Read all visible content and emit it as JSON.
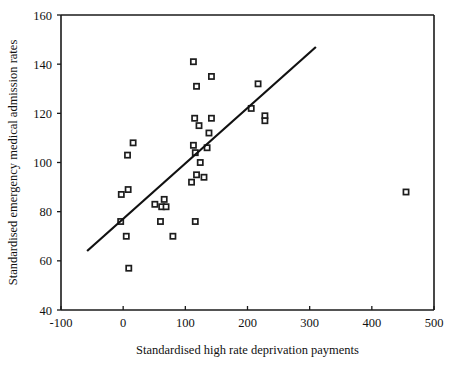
{
  "chart_data": {
    "type": "scatter",
    "title": "",
    "xlabel": "Standardised high rate deprivation payments",
    "ylabel": "Standardised emergency medical admission rates",
    "xlim": [
      -100,
      500
    ],
    "ylim": [
      40,
      160
    ],
    "xticks": [
      -100,
      0,
      100,
      200,
      300,
      400,
      500
    ],
    "yticks": [
      40,
      60,
      80,
      100,
      120,
      140,
      160
    ],
    "xtick_labels": [
      "-100",
      "0",
      "100",
      "200",
      "300",
      "400",
      "500"
    ],
    "ytick_labels": [
      "40",
      "60",
      "80",
      "100",
      "120",
      "140",
      "160"
    ],
    "grid": false,
    "legend": null,
    "marker_style": "open-square",
    "points": [
      {
        "x": 113,
        "y": 141
      },
      {
        "x": 142,
        "y": 135
      },
      {
        "x": 118,
        "y": 131
      },
      {
        "x": 217,
        "y": 132
      },
      {
        "x": 206,
        "y": 122
      },
      {
        "x": 228,
        "y": 119
      },
      {
        "x": 228,
        "y": 117
      },
      {
        "x": 142,
        "y": 118
      },
      {
        "x": 115,
        "y": 118
      },
      {
        "x": 122,
        "y": 115
      },
      {
        "x": 138,
        "y": 112
      },
      {
        "x": 16,
        "y": 108
      },
      {
        "x": 113,
        "y": 107
      },
      {
        "x": 135,
        "y": 106
      },
      {
        "x": 116,
        "y": 104
      },
      {
        "x": 7,
        "y": 103
      },
      {
        "x": 124,
        "y": 100
      },
      {
        "x": 118,
        "y": 95
      },
      {
        "x": 130,
        "y": 94
      },
      {
        "x": 110,
        "y": 92
      },
      {
        "x": 455,
        "y": 88
      },
      {
        "x": 8,
        "y": 89
      },
      {
        "x": -3,
        "y": 87
      },
      {
        "x": 66,
        "y": 85
      },
      {
        "x": 51,
        "y": 83
      },
      {
        "x": 62,
        "y": 82
      },
      {
        "x": 69,
        "y": 82
      },
      {
        "x": 60,
        "y": 76
      },
      {
        "x": 116,
        "y": 76
      },
      {
        "x": -4,
        "y": 76
      },
      {
        "x": 80,
        "y": 70
      },
      {
        "x": 5,
        "y": 70
      },
      {
        "x": 9,
        "y": 57
      }
    ],
    "trend_line": {
      "x0": -58,
      "y0": 64,
      "x1": 310,
      "y1": 147
    }
  }
}
